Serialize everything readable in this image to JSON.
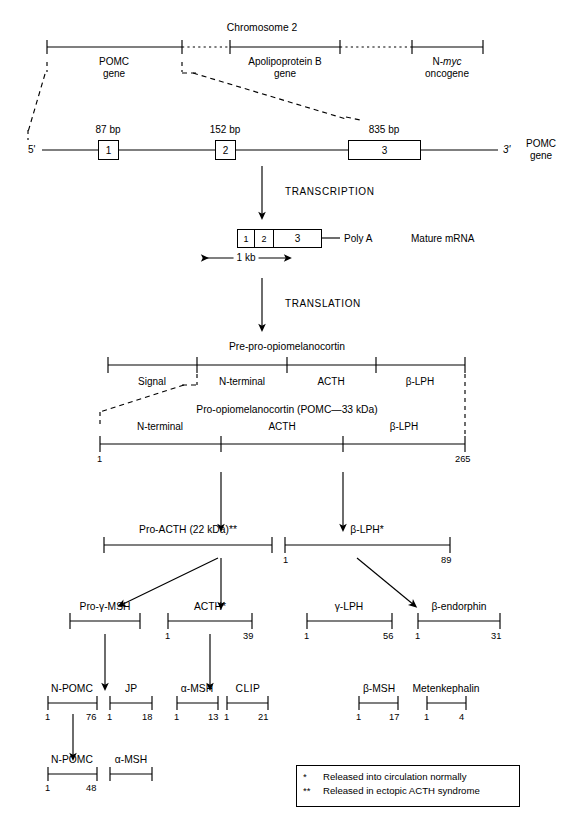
{
  "chromosome": {
    "title": "Chromosome 2",
    "loci": [
      {
        "name": "POMC",
        "sub": "gene"
      },
      {
        "name": "Apolipoprotein B",
        "sub": "gene"
      },
      {
        "name": "N-",
        "name_italic": "myc",
        "sub": "oncogene"
      }
    ]
  },
  "gene": {
    "five_prime": "5'",
    "three_prime": "3'",
    "right_label_line1": "POMC",
    "right_label_line2": "gene",
    "exons": [
      {
        "number": "1",
        "size": "87 bp"
      },
      {
        "number": "2",
        "size": "152 bp"
      },
      {
        "number": "3",
        "size": "835 bp"
      }
    ]
  },
  "steps": {
    "transcription": "TRANSCRIPTION",
    "translation": "TRANSLATION"
  },
  "mrna": {
    "segments": [
      "1",
      "2",
      "3"
    ],
    "poly_a": "Poly A",
    "label": "Mature mRNA",
    "scale": "1 kb"
  },
  "preprotein": {
    "title": "Pre-pro-opiomelanocortin",
    "domains": [
      "Signal",
      "N-terminal",
      "ACTH",
      "β-LPH"
    ]
  },
  "proprotein": {
    "title": "Pro-opiomelanocortin (POMC—33 kDa)",
    "domains": [
      "N-terminal",
      "ACTH",
      "β-LPH"
    ],
    "start": "1",
    "end": "265"
  },
  "level3": [
    {
      "name": "Pro-ACTH (22 kDa)**"
    },
    {
      "name": "β-LPH*",
      "start": "1",
      "end": "89"
    }
  ],
  "level4": [
    {
      "name": "Pro-γ-MSH"
    },
    {
      "name": "ACTH*",
      "start": "1",
      "end": "39"
    },
    {
      "name": "γ-LPH",
      "start": "1",
      "end": "56"
    },
    {
      "name": "β-endorphin",
      "start": "1",
      "end": "31"
    }
  ],
  "level5": [
    {
      "name": "N-POMC",
      "start": "1",
      "end": "76"
    },
    {
      "name": "JP",
      "start": "1",
      "end": "18"
    },
    {
      "name": "α-MSH",
      "start": "1",
      "end": "13"
    },
    {
      "name": "CLIP",
      "start": "1",
      "end": "21"
    },
    {
      "name": "β-MSH",
      "start": "1",
      "end": "17"
    },
    {
      "name": "Metenkephalin",
      "start": "1",
      "end": "4"
    }
  ],
  "level6": [
    {
      "name": "N-POMC",
      "start": "1",
      "end": "48"
    },
    {
      "name": "α-MSH"
    }
  ],
  "legend": {
    "line1_marker": "*",
    "line1": "Released into circulation normally",
    "line2_marker": "**",
    "line2": "Released in ectopic ACTH syndrome"
  },
  "colors": {
    "ink": "#000000",
    "paper": "#ffffff"
  }
}
